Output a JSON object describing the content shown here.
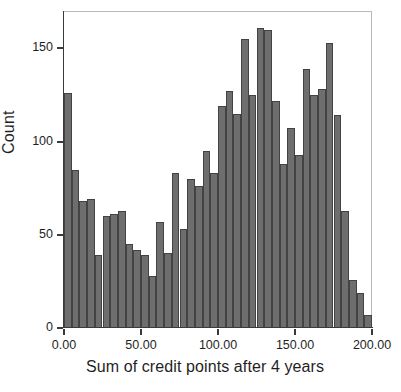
{
  "chart_data": {
    "type": "bar",
    "title": "",
    "subtitle": "",
    "xlabel": "Sum of credit points after 4 years",
    "ylabel": "Count",
    "xlim": [
      0,
      200
    ],
    "ylim": [
      0,
      170
    ],
    "grid": false,
    "legend": null,
    "bin_width": 5,
    "bar_color": "#6e6e6e",
    "bar_edge_color": "#434343",
    "xticks": [
      {
        "value": 0,
        "label": "0.00"
      },
      {
        "value": 50,
        "label": "50.00"
      },
      {
        "value": 100,
        "label": "100.00"
      },
      {
        "value": 150,
        "label": "150.00"
      },
      {
        "value": 200,
        "label": "200.00"
      }
    ],
    "yticks": [
      {
        "value": 0,
        "label": "0"
      },
      {
        "value": 50,
        "label": "50"
      },
      {
        "value": 100,
        "label": "100"
      },
      {
        "value": 150,
        "label": "150"
      }
    ],
    "bins": [
      {
        "x0": 0,
        "x1": 5,
        "count": 126
      },
      {
        "x0": 5,
        "x1": 10,
        "count": 85
      },
      {
        "x0": 10,
        "x1": 15,
        "count": 68
      },
      {
        "x0": 15,
        "x1": 20,
        "count": 69
      },
      {
        "x0": 20,
        "x1": 25,
        "count": 39
      },
      {
        "x0": 25,
        "x1": 30,
        "count": 60
      },
      {
        "x0": 30,
        "x1": 35,
        "count": 61
      },
      {
        "x0": 35,
        "x1": 40,
        "count": 63
      },
      {
        "x0": 40,
        "x1": 45,
        "count": 45
      },
      {
        "x0": 45,
        "x1": 50,
        "count": 42
      },
      {
        "x0": 50,
        "x1": 55,
        "count": 39
      },
      {
        "x0": 55,
        "x1": 60,
        "count": 28
      },
      {
        "x0": 60,
        "x1": 65,
        "count": 57
      },
      {
        "x0": 65,
        "x1": 70,
        "count": 40
      },
      {
        "x0": 70,
        "x1": 75,
        "count": 83
      },
      {
        "x0": 75,
        "x1": 80,
        "count": 53
      },
      {
        "x0": 80,
        "x1": 85,
        "count": 80
      },
      {
        "x0": 85,
        "x1": 90,
        "count": 76
      },
      {
        "x0": 90,
        "x1": 95,
        "count": 95
      },
      {
        "x0": 95,
        "x1": 100,
        "count": 83
      },
      {
        "x0": 100,
        "x1": 105,
        "count": 119
      },
      {
        "x0": 105,
        "x1": 110,
        "count": 127
      },
      {
        "x0": 110,
        "x1": 115,
        "count": 115
      },
      {
        "x0": 115,
        "x1": 120,
        "count": 155
      },
      {
        "x0": 120,
        "x1": 125,
        "count": 125
      },
      {
        "x0": 125,
        "x1": 130,
        "count": 161
      },
      {
        "x0": 130,
        "x1": 135,
        "count": 160
      },
      {
        "x0": 135,
        "x1": 140,
        "count": 122
      },
      {
        "x0": 140,
        "x1": 145,
        "count": 88
      },
      {
        "x0": 145,
        "x1": 150,
        "count": 107
      },
      {
        "x0": 150,
        "x1": 155,
        "count": 93
      },
      {
        "x0": 155,
        "x1": 160,
        "count": 139
      },
      {
        "x0": 160,
        "x1": 165,
        "count": 125
      },
      {
        "x0": 165,
        "x1": 170,
        "count": 128
      },
      {
        "x0": 170,
        "x1": 175,
        "count": 153
      },
      {
        "x0": 175,
        "x1": 180,
        "count": 114
      },
      {
        "x0": 180,
        "x1": 185,
        "count": 63
      },
      {
        "x0": 185,
        "x1": 190,
        "count": 26
      },
      {
        "x0": 190,
        "x1": 195,
        "count": 19
      },
      {
        "x0": 195,
        "x1": 200,
        "count": 7
      },
      {
        "x0": 200,
        "x1": 205,
        "count": 8
      },
      {
        "x0": 205,
        "x1": 210,
        "count": 3
      },
      {
        "x0": 210,
        "x1": 215,
        "count": 2
      }
    ]
  }
}
